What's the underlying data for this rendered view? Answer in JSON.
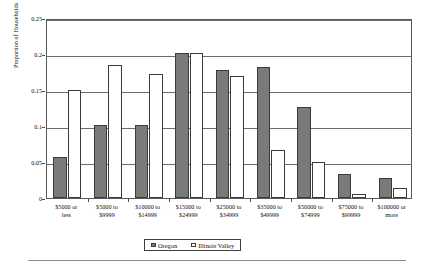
{
  "chart_data": {
    "type": "bar",
    "title": "",
    "xlabel": "",
    "ylabel": "Proportion of Households",
    "ylim": [
      0,
      0.25
    ],
    "ytick_values": [
      0,
      0.05,
      0.1,
      0.15,
      0.2,
      0.25
    ],
    "ytick_labels": [
      "0",
      "0.05",
      "0.1",
      "0.15",
      "0.2",
      "0.25"
    ],
    "grid": true,
    "legend_position": "bottom-center",
    "categories": [
      "$5000 or less",
      "$5000 to $9999",
      "$10000 to $14999",
      "$15000 to $24999",
      "$25000 to $34999",
      "$35000 to $49999",
      "$50000 to $74999",
      "$75000 to $99999",
      "$100000 or more"
    ],
    "category_lines": [
      [
        "$5000 or",
        "less"
      ],
      [
        "$5000 to",
        "$9999"
      ],
      [
        "$10000 to",
        "$14999"
      ],
      [
        "$15000 to",
        "$24999"
      ],
      [
        "$25000 to",
        "$34999"
      ],
      [
        "$35000 to",
        "$49999"
      ],
      [
        "$50000 to",
        "$74999"
      ],
      [
        "$75000 to",
        "$99999"
      ],
      [
        "$100000 or",
        "more"
      ]
    ],
    "series": [
      {
        "name": "Oregon",
        "color": "#7a7a7a",
        "values": [
          0.057,
          0.101,
          0.102,
          0.202,
          0.178,
          0.182,
          0.126,
          0.034,
          0.028
        ]
      },
      {
        "name": "Illinois Valley",
        "color": "#ffffff",
        "values": [
          0.15,
          0.185,
          0.172,
          0.202,
          0.17,
          0.067,
          0.05,
          0.005,
          0.014
        ]
      }
    ]
  },
  "legend": {
    "items": [
      {
        "label": "Oregon",
        "swatch": "oregon"
      },
      {
        "label": "Illinois Valley",
        "swatch": "iv"
      }
    ]
  }
}
